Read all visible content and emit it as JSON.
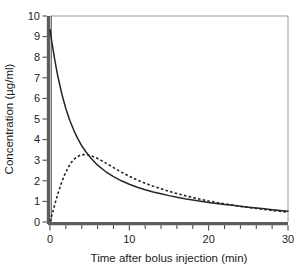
{
  "chart_data": {
    "type": "line",
    "title": "",
    "xlabel": "Time after bolus injection (min)",
    "ylabel": "Concentration (µg/ml)",
    "xlim": [
      0,
      30
    ],
    "ylim": [
      0,
      10
    ],
    "xticks": [
      0,
      10,
      20,
      30
    ],
    "xtick_labels": [
      "0",
      "10",
      "20",
      "30"
    ],
    "xminor_ticks": [
      2,
      4,
      6,
      8,
      12,
      14,
      16,
      18,
      22,
      24,
      26,
      28
    ],
    "yticks": [
      0,
      1,
      2,
      3,
      4,
      5,
      6,
      7,
      8,
      9,
      10
    ],
    "ytick_labels": [
      "0",
      "1",
      "2",
      "3",
      "4",
      "5",
      "6",
      "7",
      "8",
      "9",
      "10"
    ],
    "grid": false,
    "legend": "none",
    "series": [
      {
        "name": "bolus-injection",
        "style": "solid",
        "color": "#262626",
        "x": [
          0,
          0.25,
          0.5,
          0.75,
          1,
          1.5,
          2,
          2.5,
          3,
          3.5,
          4,
          4.5,
          5,
          6,
          7,
          8,
          9,
          10,
          11,
          12,
          13,
          14,
          15,
          16,
          17,
          18,
          19,
          20,
          21,
          22,
          23,
          24,
          25,
          26,
          27,
          28,
          29,
          30
        ],
        "y": [
          9.35,
          8.7,
          8.1,
          7.55,
          7.05,
          6.2,
          5.5,
          4.93,
          4.45,
          4.05,
          3.7,
          3.42,
          3.17,
          2.76,
          2.45,
          2.2,
          2.0,
          1.83,
          1.69,
          1.57,
          1.46,
          1.37,
          1.28,
          1.2,
          1.13,
          1.07,
          1.01,
          0.95,
          0.9,
          0.85,
          0.81,
          0.76,
          0.72,
          0.68,
          0.64,
          0.6,
          0.56,
          0.52
        ]
      },
      {
        "name": "infusion",
        "style": "dashed",
        "color": "#262626",
        "x": [
          0,
          0.3,
          0.6,
          1,
          1.4,
          1.8,
          2.2,
          2.6,
          3,
          3.4,
          3.8,
          4.2,
          4.6,
          5,
          5.5,
          6,
          6.5,
          7,
          8,
          9,
          10,
          11,
          12,
          13,
          14,
          15,
          16,
          17,
          18,
          19,
          20,
          21,
          22,
          23,
          24,
          25,
          26,
          27,
          28,
          29,
          30
        ],
        "y": [
          0.02,
          0.42,
          0.85,
          1.38,
          1.85,
          2.25,
          2.58,
          2.85,
          3.03,
          3.16,
          3.24,
          3.27,
          3.27,
          3.24,
          3.17,
          3.08,
          2.98,
          2.87,
          2.64,
          2.42,
          2.22,
          2.04,
          1.88,
          1.74,
          1.61,
          1.49,
          1.38,
          1.28,
          1.19,
          1.1,
          1.02,
          0.95,
          0.88,
          0.82,
          0.76,
          0.71,
          0.66,
          0.61,
          0.56,
          0.52,
          0.48
        ]
      }
    ],
    "annotations": {
      "solid_peak": 9.35,
      "dashed_peak_value": 3.27,
      "dashed_peak_time": 4.4,
      "crossover_time": 4.3,
      "crossover_value": 3.25
    }
  },
  "figure": {
    "background_color": "#ffffff",
    "axis_color": "#5d5d5d",
    "frame_color": "#9a9a9a",
    "curve_color": "#262626"
  }
}
